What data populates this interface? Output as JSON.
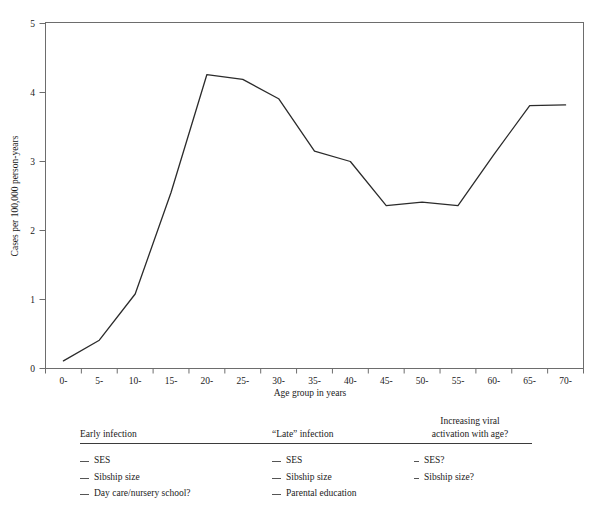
{
  "chart_data": {
    "type": "line",
    "title": "",
    "xlabel": "Age group in years",
    "ylabel": "Cases per 100,000 person-years",
    "categories": [
      "0-",
      "5-",
      "10-",
      "15-",
      "20-",
      "25-",
      "30-",
      "35-",
      "40-",
      "45-",
      "50-",
      "55-",
      "60-",
      "65-",
      "70-"
    ],
    "values": [
      0.11,
      0.41,
      1.08,
      2.55,
      4.26,
      4.19,
      3.91,
      3.15,
      3.0,
      2.36,
      2.41,
      2.36,
      3.1,
      3.81,
      3.82
    ],
    "xtick_labels": [
      "0-",
      "5-",
      "10-",
      "15-",
      "20-",
      "25-",
      "30-",
      "35-",
      "40-",
      "45-",
      "50-",
      "55-",
      "60-",
      "65-",
      "70-"
    ],
    "ytick_labels": [
      "0",
      "1",
      "2",
      "3",
      "4",
      "5"
    ],
    "ylim": [
      0,
      5
    ],
    "grid": false,
    "legend": false,
    "line_color": "#2b2b2b",
    "axis_color": "#666666"
  },
  "factor_table": {
    "columns": [
      {
        "header": "Early infection",
        "header_line2": "",
        "items": [
          "SES",
          "Sibship size",
          "Day care/nursery school?"
        ]
      },
      {
        "header": "“Late” infection",
        "header_line2": "",
        "items": [
          "SES",
          "Sibship size",
          "Parental education"
        ]
      },
      {
        "header": "Increasing viral",
        "header_line2": "activation with age?",
        "items": [
          "SES?",
          "Sibship size?"
        ]
      }
    ]
  }
}
